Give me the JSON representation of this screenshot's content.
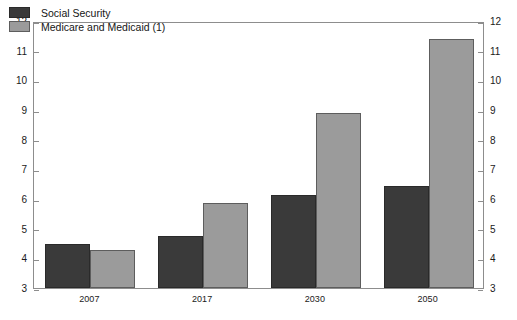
{
  "chart_data": {
    "type": "bar",
    "title": "",
    "subtitle": "",
    "xlabel": "",
    "ylabel": "",
    "categories": [
      "2007",
      "2017",
      "2030",
      "2050"
    ],
    "series": [
      {
        "name": "Social Security",
        "color": "#3a3a3a",
        "values": [
          4.5,
          4.75,
          6.15,
          6.45
        ]
      },
      {
        "name": "Medicare and Medicaid (1)",
        "color": "#9b9b9b",
        "values": [
          4.28,
          5.85,
          8.9,
          11.4
        ]
      }
    ],
    "ylim": [
      3,
      12
    ],
    "ytick_labels_left": [
      "12",
      "11",
      "10",
      "9",
      "8",
      "7",
      "6",
      "5",
      "4",
      "3"
    ],
    "ytick_labels_right": [
      "12",
      "11",
      "10",
      "9",
      "8",
      "7",
      "6",
      "5",
      "4",
      "3"
    ],
    "ytick_values": [
      12,
      11,
      10,
      9,
      8,
      7,
      6,
      5,
      4,
      3
    ],
    "grid": false,
    "legend_position": "top-left",
    "axis_color": "#8d8d8d",
    "background_color": "#ffffff"
  }
}
